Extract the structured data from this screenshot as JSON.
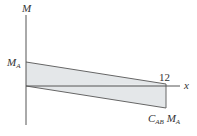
{
  "diagram": {
    "y_axis_label": "M",
    "x_axis_label": "x",
    "left_value_label": "M",
    "left_value_sub": "A",
    "x_end_tick": "12",
    "bottom_label_c": "C",
    "bottom_label_c_sub": "AB",
    "bottom_label_m": "M",
    "bottom_label_m_sub": "A",
    "fill_color": "#e4e7e9",
    "line_color": "#555555"
  }
}
